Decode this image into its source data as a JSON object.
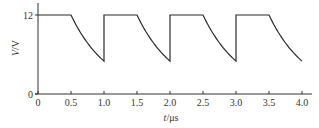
{
  "chart_data": {
    "type": "line",
    "title": "",
    "xlabel": "t/μs",
    "xlabel_var": "t",
    "xlabel_unit": "/μs",
    "ylabel": "V/V",
    "ylabel_var": "V",
    "ylabel_unit": "/V",
    "xlim": [
      0,
      4.1
    ],
    "ylim": [
      0,
      13
    ],
    "grid": false,
    "x_ticks": [
      0,
      0.5,
      1.0,
      1.5,
      2.0,
      2.5,
      3.0,
      3.5,
      4.0
    ],
    "x_tick_labels": [
      "0",
      "0.5",
      "1.0",
      "1.5",
      "2.0",
      "2.5",
      "3.0",
      "3.5",
      "4.0"
    ],
    "y_ticks": [
      0,
      12
    ],
    "y_tick_labels": [
      "0",
      "12"
    ],
    "series": [
      {
        "name": "V",
        "description": "Square-ish waveform: holds 12 V for 0.5 μs, then decays exponentially to about 5 V over 0.5 μs, then jumps back to 12 V",
        "high_value": 12,
        "low_value": 5,
        "period": 1.0,
        "segments": [
          {
            "from": 0.0,
            "to": 0.5,
            "shape": "flat",
            "value": 12
          },
          {
            "from": 0.5,
            "to": 1.0,
            "shape": "exp-decay",
            "start": 12,
            "end": 5
          },
          {
            "from": 1.0,
            "to": 1.5,
            "shape": "flat",
            "value": 12
          },
          {
            "from": 1.5,
            "to": 2.0,
            "shape": "exp-decay",
            "start": 12,
            "end": 5
          },
          {
            "from": 2.0,
            "to": 2.5,
            "shape": "flat",
            "value": 12
          },
          {
            "from": 2.5,
            "to": 3.0,
            "shape": "exp-decay",
            "start": 12,
            "end": 5
          },
          {
            "from": 3.0,
            "to": 3.5,
            "shape": "flat",
            "value": 12
          },
          {
            "from": 3.5,
            "to": 4.0,
            "shape": "exp-decay",
            "start": 12,
            "end": 5
          }
        ]
      }
    ]
  },
  "style": {
    "line_color": "#2a2a2a",
    "axis_color": "#333333"
  }
}
